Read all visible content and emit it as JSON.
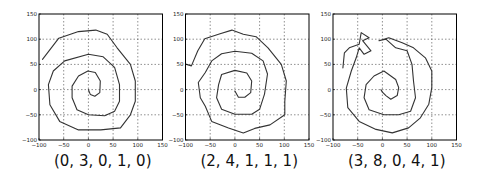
{
  "chart_data": [
    {
      "type": "line",
      "title": "(0, 3, 0, 1, 0)",
      "xlabel": "",
      "ylabel": "",
      "xlim": [
        -100,
        150
      ],
      "ylim": [
        -100,
        150
      ],
      "xticks": [
        -100,
        -50,
        0,
        50,
        100,
        150
      ],
      "yticks": [
        -100,
        -50,
        0,
        50,
        100,
        150
      ],
      "grid": true,
      "series": [
        {
          "name": "spiral",
          "x": [
            -93,
            -60,
            -20,
            15,
            38,
            58,
            85,
            95,
            95,
            85,
            65,
            25,
            -20,
            -58,
            -78,
            -81,
            -71,
            -48,
            0,
            30,
            53,
            63,
            63,
            53,
            33,
            0,
            -23,
            -33,
            -33,
            -20,
            -1,
            14,
            24,
            23,
            13,
            4,
            0
          ],
          "y": [
            60,
            102,
            115,
            118,
            110,
            83,
            50,
            17,
            -23,
            -50,
            -76,
            -80,
            -80,
            -63,
            -30,
            10,
            37,
            57,
            70,
            65,
            44,
            10,
            -23,
            -43,
            -52,
            -50,
            -40,
            -16,
            7,
            27,
            37,
            34,
            17,
            -6,
            -13,
            -10,
            0
          ]
        }
      ]
    },
    {
      "type": "line",
      "title": "(2, 4, 1, 1, 1)",
      "xlabel": "",
      "ylabel": "",
      "xlim": [
        -100,
        150
      ],
      "ylim": [
        -100,
        150
      ],
      "xticks": [
        -100,
        -50,
        0,
        50,
        100,
        150
      ],
      "yticks": [
        -100,
        -50,
        0,
        50,
        100,
        150
      ],
      "grid": true,
      "series": [
        {
          "name": "spiral",
          "x": [
            -98,
            -88,
            -75,
            -61,
            -30,
            -6,
            17,
            43,
            67,
            94,
            104,
            101,
            101,
            71,
            40,
            17,
            -13,
            -47,
            -60,
            -70,
            -74,
            -60,
            -47,
            -27,
            0,
            34,
            57,
            66,
            60,
            50,
            34,
            0,
            -27,
            -37,
            -33,
            -27,
            0,
            24,
            34,
            32,
            20,
            7,
            0
          ],
          "y": [
            50,
            47,
            77,
            101,
            111,
            118,
            110,
            105,
            83,
            50,
            17,
            -23,
            -50,
            -70,
            -77,
            -86,
            -76,
            -63,
            -33,
            -16,
            14,
            34,
            57,
            71,
            76,
            72,
            57,
            31,
            -9,
            -39,
            -49,
            -49,
            -39,
            -16,
            10,
            30,
            38,
            33,
            17,
            -6,
            -15,
            -15,
            -3
          ]
        }
      ]
    },
    {
      "type": "line",
      "title": "(3, 8, 0, 4, 1)",
      "xlabel": "",
      "ylabel": "",
      "xlim": [
        -100,
        150
      ],
      "ylim": [
        -100,
        150
      ],
      "xticks": [
        -100,
        -50,
        0,
        50,
        100,
        150
      ],
      "yticks": [
        -100,
        -50,
        0,
        50,
        100,
        150
      ],
      "grid": true,
      "series": [
        {
          "name": "spiral",
          "x": [
            -80,
            -77,
            -67,
            -47,
            -43,
            -27,
            -40,
            -23,
            -37,
            -47,
            -53,
            -63,
            -73,
            -70,
            -47,
            -13,
            20,
            53,
            77,
            94,
            100,
            100,
            87,
            63,
            40,
            13,
            -7,
            7,
            27,
            50,
            60,
            63,
            67,
            57,
            33,
            3,
            -27,
            -37,
            -33,
            -17,
            3,
            27,
            33,
            30,
            17,
            7,
            0,
            -3
          ],
          "y": [
            43,
            73,
            83,
            90,
            113,
            103,
            97,
            77,
            70,
            83,
            63,
            37,
            3,
            -36,
            -63,
            -79,
            -86,
            -76,
            -56,
            -29,
            4,
            37,
            63,
            83,
            93,
            103,
            97,
            100,
            83,
            77,
            50,
            17,
            -16,
            -43,
            -50,
            -50,
            -40,
            -16,
            10,
            27,
            37,
            20,
            4,
            -12,
            -19,
            -12,
            -5,
            0
          ]
        }
      ]
    }
  ],
  "panels": [
    {
      "caption": "(0, 3, 0, 1, 0)"
    },
    {
      "caption": "(2, 4, 1, 1, 1)"
    },
    {
      "caption": "(3, 8, 0, 4, 1)"
    }
  ],
  "tick_labels": [
    "-100",
    "-50",
    "0",
    "50",
    "100",
    "150"
  ],
  "colors": {
    "line": "#333333",
    "frame": "#000000",
    "grid": "#444444",
    "background": "#ffffff"
  }
}
